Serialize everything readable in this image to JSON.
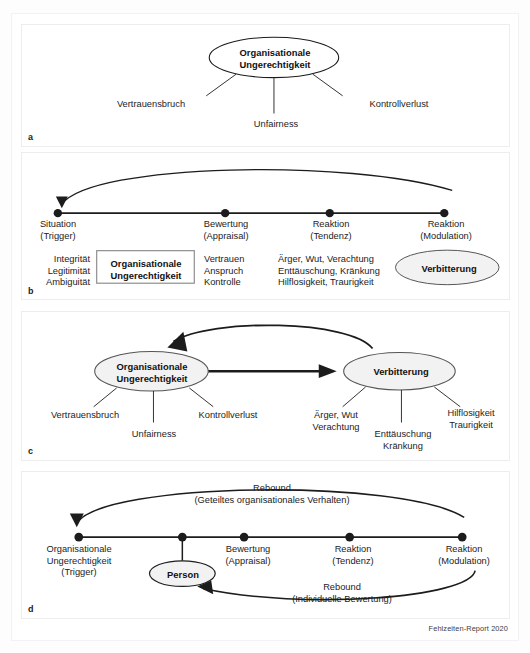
{
  "figure": {
    "footer_credit": "Fehlzeiten-Report 2020",
    "colors": {
      "line": "#1c1c1c",
      "node_fill_white": "#ffffff",
      "node_fill_gray": "#f0f0f0",
      "panel_border": "#ededed",
      "text": "#1c1c1c"
    }
  },
  "panels": {
    "a": {
      "letter": "a",
      "node": "Organisationale\nUngerechtigkeit",
      "node_shape": "ellipse",
      "leaves": [
        {
          "label": "Vertrauensbruch"
        },
        {
          "label": "Unfairness"
        },
        {
          "label": "Kontrollverlust"
        }
      ]
    },
    "b": {
      "letter": "b",
      "timeline_points": [
        {
          "line1": "Situation",
          "line2": "(Trigger)"
        },
        {
          "line1": "Bewertung",
          "line2": "(Appraisal)"
        },
        {
          "line1": "Reaktion",
          "line2": "(Tendenz)"
        },
        {
          "line1": "Reaktion",
          "line2": "(Modulation)"
        }
      ],
      "columns": {
        "col1": "Integrität\nLegitimität\nAmbiguität",
        "box": "Organisationale\nUngerechtigkeit",
        "col2": "Vertrauen\nAnspruch\nKontrolle",
        "col3": "Ärger, Wut, Verachtung\nEnttäuschung, Kränkung\nHilflosigkeit, Traurigkeit",
        "ellipse": "Verbitterung"
      }
    },
    "c": {
      "letter": "c",
      "left_node": "Organisationale\nUngerechtigkeit",
      "right_node": "Verbitterung",
      "left_leaves": [
        {
          "label": "Vertrauensbruch"
        },
        {
          "label": "Unfairness"
        },
        {
          "label": "Kontrollverlust"
        }
      ],
      "right_leaves": [
        {
          "label": "Ärger, Wut\nVerachtung"
        },
        {
          "label": "Enttäuschung\nKränkung"
        },
        {
          "label": "Hilflosigkeit\nTraurigkeit"
        }
      ]
    },
    "d": {
      "letter": "d",
      "timeline_points": [
        {
          "line1": "Organisationale",
          "line2": "Ungerechtigkeit",
          "line3": "(Trigger)"
        },
        {
          "line1": "",
          "line2": "",
          "line3": ""
        },
        {
          "line1": "Bewertung",
          "line2": "(Appraisal)",
          "line3": ""
        },
        {
          "line1": "Reaktion",
          "line2": "(Tendenz)",
          "line3": ""
        },
        {
          "line1": "Reaktion",
          "line2": "(Modulation)",
          "line3": ""
        }
      ],
      "person_node": "Person",
      "rebound_top": "Rebound\n(Geteiltes organisationales Verhalten)",
      "rebound_top_line1": "Rebound",
      "rebound_top_line2": "(Geteiltes organisationales Verhalten)",
      "rebound_bottom_line1": "Rebound",
      "rebound_bottom_line2": "(Individuelle Bewertung)"
    }
  }
}
